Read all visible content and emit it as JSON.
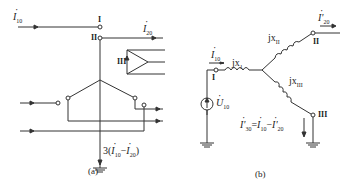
{
  "figure_a": {
    "caption": "(a)",
    "current_in": {
      "symbol": "I",
      "sub": "10"
    },
    "current_out": {
      "symbol": "I",
      "sub": "20"
    },
    "node_I": "I",
    "node_II": "II",
    "node_III": "III",
    "ground_current": {
      "prefix": "3(",
      "a": "I",
      "a_sub": "10",
      "minus": "−",
      "b": "I",
      "b_sub": "20",
      "suffix": ")"
    }
  },
  "figure_b": {
    "caption": "(b)",
    "current_in": {
      "symbol": "I",
      "sub": "10"
    },
    "current_out": {
      "symbol": "I'",
      "sub": "20"
    },
    "source": {
      "symbol": "U",
      "sub": "10"
    },
    "reactance_1": "jx",
    "reactance_1_sub": "1",
    "reactance_2": "jx",
    "reactance_2_sub": "II",
    "reactance_3": "jx",
    "reactance_3_sub": "III",
    "node_I": "I",
    "node_II": "II",
    "node_III": "III",
    "equation": {
      "lhs": "I'",
      "lhs_sub": "30",
      "eq": "=",
      "a": "I",
      "a_sub": "10",
      "minus": "−",
      "b": "I'",
      "b_sub": "20"
    }
  }
}
